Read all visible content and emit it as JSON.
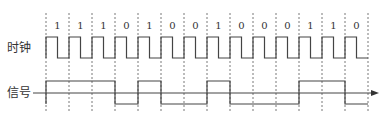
{
  "labels": {
    "clock": "时钟",
    "signal": "信号"
  },
  "bits": [
    "1",
    "1",
    "1",
    "0",
    "1",
    "0",
    "0",
    "1",
    "0",
    "0",
    "0",
    "1",
    "1",
    "0"
  ],
  "layout": {
    "x0": 46,
    "step": 23,
    "grid_top": 13,
    "grid_bottom": 112,
    "bit_label_y": 20,
    "clock_high": 37,
    "clock_low": 58,
    "signal_high": 81,
    "signal_low": 104,
    "axis_y": 93,
    "axis_start": 33,
    "axis_end": 379
  },
  "colors": {
    "line": "#444444",
    "grid": "#555555"
  }
}
